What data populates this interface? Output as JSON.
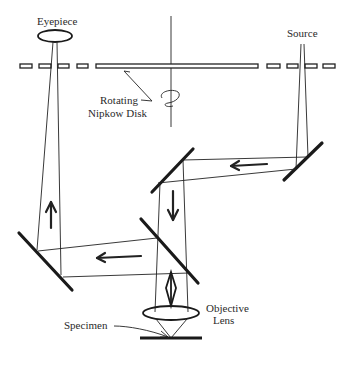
{
  "diagram": {
    "labels": {
      "eyepiece": "Eyepiece",
      "source": "Source",
      "rotating_line1": "Rotating",
      "rotating_line2": "Nipkow Disk",
      "objective_line1": "Objective",
      "objective_line2": "Lens",
      "specimen": "Specimen"
    },
    "components": [
      {
        "id": "eyepiece",
        "type": "lens"
      },
      {
        "id": "source",
        "type": "light-source"
      },
      {
        "id": "nipkow-disk",
        "type": "rotating-disk"
      },
      {
        "id": "right-mirror",
        "type": "mirror"
      },
      {
        "id": "upper-center-mirror",
        "type": "mirror"
      },
      {
        "id": "beamsplitter",
        "type": "mirror"
      },
      {
        "id": "left-mirror",
        "type": "mirror"
      },
      {
        "id": "objective-lens",
        "type": "lens"
      },
      {
        "id": "specimen",
        "type": "sample"
      }
    ],
    "arrows": [
      {
        "id": "arrow-right-to-left-upper",
        "direction": "left"
      },
      {
        "id": "arrow-down-center",
        "direction": "down"
      },
      {
        "id": "arrow-right-to-left-lower",
        "direction": "left"
      },
      {
        "id": "arrow-up-left",
        "direction": "up"
      },
      {
        "id": "arrow-bidirectional-objective",
        "direction": "up-down"
      }
    ],
    "colors": {
      "line": "#222222",
      "background": "#ffffff"
    }
  }
}
